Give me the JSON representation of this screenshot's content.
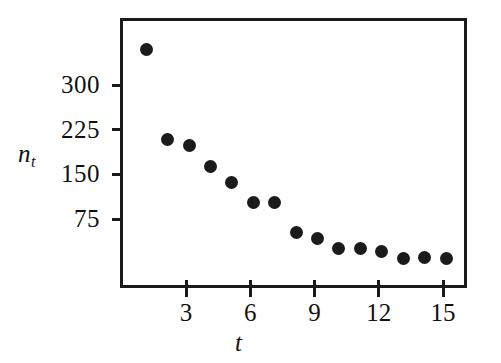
{
  "figure": {
    "background_color": "#ffffff",
    "ink_color": "#1b1b1b"
  },
  "axes": {
    "y": {
      "label": "n",
      "label_subscript": "t",
      "ticks": [
        {
          "value": 300,
          "text": "300"
        },
        {
          "value": 225,
          "text": "225"
        },
        {
          "value": 150,
          "text": "150"
        },
        {
          "value": 75,
          "text": "75"
        }
      ]
    },
    "x": {
      "label": "t",
      "ticks": [
        {
          "value": 3,
          "text": "3"
        },
        {
          "value": 6,
          "text": "6"
        },
        {
          "value": 9,
          "text": "9"
        },
        {
          "value": 12,
          "text": "12"
        },
        {
          "value": 15,
          "text": "15"
        }
      ]
    }
  },
  "chart_data": {
    "type": "scatter",
    "title": "",
    "xlabel": "t",
    "ylabel": "n_t",
    "xlim": [
      0,
      15.9
    ],
    "ylim": [
      0,
      380
    ],
    "grid": false,
    "legend": null,
    "marker": {
      "shape": "circle",
      "color": "#1b1b1b",
      "size": 13
    },
    "x": [
      1,
      2,
      3,
      4,
      5,
      6,
      7,
      8,
      9,
      10,
      11,
      12,
      13,
      14,
      15
    ],
    "values": [
      364,
      213,
      203,
      169,
      141,
      107,
      107,
      58,
      48,
      31,
      31,
      26,
      14,
      16,
      13
    ],
    "points": [
      {
        "t": 1,
        "n": 364
      },
      {
        "t": 2,
        "n": 213
      },
      {
        "t": 3,
        "n": 203
      },
      {
        "t": 4,
        "n": 169
      },
      {
        "t": 5,
        "n": 141
      },
      {
        "t": 6,
        "n": 107
      },
      {
        "t": 7,
        "n": 107
      },
      {
        "t": 8,
        "n": 58
      },
      {
        "t": 9,
        "n": 48
      },
      {
        "t": 10,
        "n": 31
      },
      {
        "t": 11,
        "n": 31
      },
      {
        "t": 12,
        "n": 26
      },
      {
        "t": 13,
        "n": 14
      },
      {
        "t": 14,
        "n": 16
      },
      {
        "t": 15,
        "n": 13
      }
    ]
  }
}
